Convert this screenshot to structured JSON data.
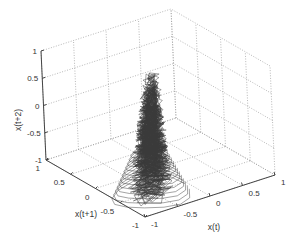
{
  "chart_data": {
    "type": "line3d",
    "title": "",
    "xlabel": "x(t)",
    "ylabel": "x(t+1)",
    "zlabel": "x(t+2)",
    "xlim": [
      -1,
      1
    ],
    "ylim": [
      -1,
      1
    ],
    "zlim": [
      -1,
      1
    ],
    "xticks": [
      "-1",
      "-0.5",
      "0",
      "0.5",
      "1"
    ],
    "yticks": [
      "-1",
      "-0.5",
      "0",
      "0.5",
      "1"
    ],
    "zticks": [
      "-1",
      "-0.5",
      "0",
      "0.5",
      "1"
    ],
    "grid": true,
    "legend": null,
    "cluster": {
      "center": [
        -0.45,
        -0.45,
        0.1
      ],
      "z_range": [
        -1,
        1
      ],
      "line_color": "#3a3a3a"
    }
  },
  "colors": {
    "background": "#ffffff",
    "axis": "#444444",
    "grid": "#9a9a9a",
    "trajectory": "#3a3a3a"
  }
}
